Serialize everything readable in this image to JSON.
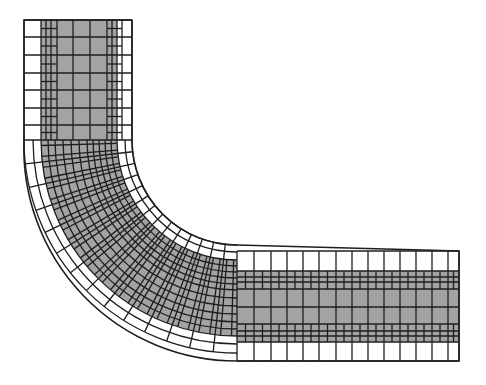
{
  "diagram": {
    "title": "",
    "type": "quadtree-refined mesh of an L-shaped bent channel",
    "colors": {
      "background": "#ffffff",
      "fill_core": "#a3a3a3",
      "fill_outer": "#ffffff",
      "line": "#1e1e1e"
    },
    "geometry": {
      "bend_center": [
        237,
        140
      ],
      "outer_radius": 213,
      "inner_radius": 105,
      "core_outer_radius": 196,
      "core_inner_radius": 120,
      "vertical_leg": {
        "x_left": 24,
        "x_right": 132,
        "y_top": 20,
        "y_bottom": 140,
        "core_x_left": 41,
        "core_x_right": 117,
        "columns": [
          24,
          41,
          46,
          51,
          57,
          73,
          90,
          107,
          112,
          117,
          122,
          132
        ],
        "rows": [
          20,
          37,
          55,
          73,
          90,
          108,
          125,
          140
        ]
      },
      "horizontal_leg": {
        "x_left": 237,
        "x_right": 459,
        "y_top": 251,
        "y_bottom": 361,
        "core_y_top": 271,
        "core_y_bottom": 342,
        "rows": [
          251,
          271,
          277,
          282,
          289,
          307,
          324,
          331,
          336,
          342,
          361
        ],
        "columns": [
          237,
          254,
          271,
          287,
          303,
          319,
          336,
          352,
          368,
          384,
          400,
          416,
          432,
          448,
          459
        ]
      },
      "bend_radial_lines": 14,
      "bend_rings": [
        105,
        112,
        120,
        126,
        132,
        138,
        144,
        150,
        158,
        166,
        174,
        182,
        189,
        196,
        204,
        213
      ]
    }
  }
}
